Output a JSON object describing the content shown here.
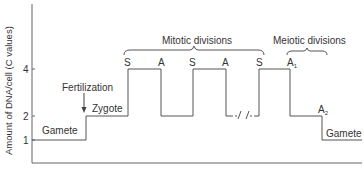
{
  "diagram": {
    "ylabel": "Amount of DNA/cell (C values)",
    "y_ticks": [
      {
        "label": "4",
        "value": 4
      },
      {
        "label": "2",
        "value": 2
      },
      {
        "label": "1",
        "value": 1
      }
    ],
    "labels": {
      "gamete_left": "Gamete",
      "fertilization": "Fertilization",
      "zygote": "Zygote",
      "mitotic": "Mitotic divisions",
      "meiotic": "Meiotic divisions",
      "gamete_right": "Gamete",
      "s1": "S",
      "a1": "A",
      "s2": "S",
      "a2": "A",
      "s3": "S",
      "a_meiotic_1": "A",
      "a_meiotic_1_sub": "1",
      "a_meiotic_2": "A",
      "a_meiotic_2_sub": "2"
    },
    "colors": {
      "line": "#555555",
      "text": "#333333"
    }
  }
}
